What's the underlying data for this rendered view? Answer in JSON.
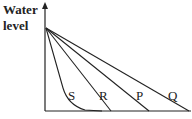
{
  "diagram": {
    "y_axis_label_line1": "Water",
    "y_axis_label_line2": "level",
    "curves": [
      {
        "label": "S",
        "x": 72,
        "y": 90
      },
      {
        "label": "R",
        "x": 96,
        "y": 90
      },
      {
        "label": "P",
        "x": 133,
        "y": 90
      },
      {
        "label": "Q",
        "x": 167,
        "y": 90
      }
    ],
    "line_color": "#222222"
  }
}
